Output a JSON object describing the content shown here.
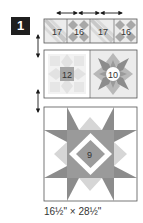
{
  "step": {
    "number": "1"
  },
  "top_row": {
    "blocks": [
      {
        "label": "17",
        "type": "diagonal"
      },
      {
        "label": "16",
        "type": "four-patch-diamonds"
      },
      {
        "label": "17",
        "type": "diagonal"
      },
      {
        "label": "16",
        "type": "four-patch-diamonds"
      }
    ],
    "arrows": "horizontal double arrows between blocks"
  },
  "middle_row": {
    "blocks": [
      {
        "label": "12",
        "type": "light-star"
      },
      {
        "label": "10",
        "type": "dark-star"
      }
    ]
  },
  "bottom_block": {
    "label": "9",
    "type": "large-star"
  },
  "dimensions": "16½\" × 28½\"",
  "colors": {
    "badge": "#1f1f1f",
    "border": "#555555",
    "dark_gray": "#8c8c8c",
    "mid_gray": "#b0b0b0",
    "light_gray": "#d8d8d8",
    "very_light_gray": "#ebebeb"
  }
}
